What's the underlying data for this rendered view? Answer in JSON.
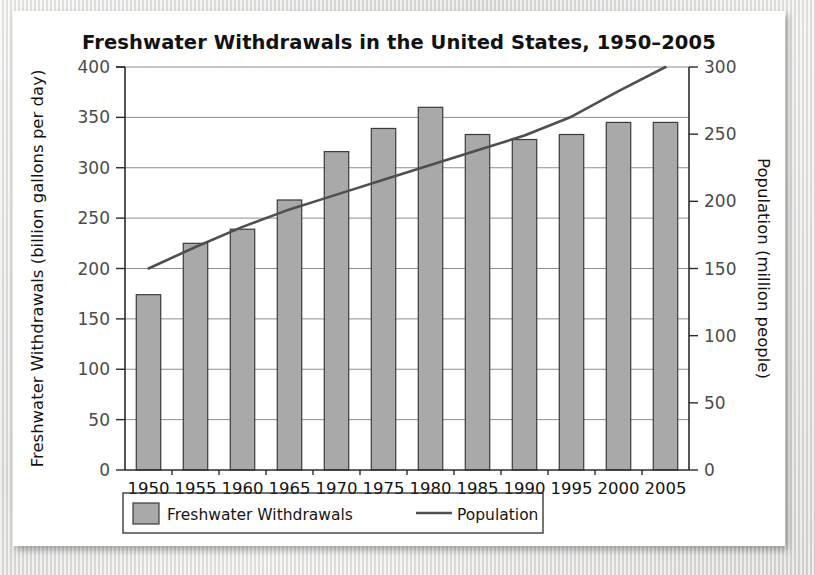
{
  "chart_data": {
    "type": "bar",
    "title": "Freshwater Withdrawals in the United States, 1950–2005",
    "categories": [
      "1950",
      "1955",
      "1960",
      "1965",
      "1970",
      "1975",
      "1980",
      "1985",
      "1990",
      "1995",
      "2000",
      "2005"
    ],
    "xlabel": "",
    "ylabel": "Freshwater Withdrawals (billion gallons per day)",
    "y2label": "Population (million people)",
    "ylim": [
      0,
      400
    ],
    "y2lim": [
      0,
      300
    ],
    "yticks": [
      0,
      50,
      100,
      150,
      200,
      250,
      300,
      350,
      400
    ],
    "y2ticks": [
      0,
      50,
      100,
      150,
      200,
      250,
      300
    ],
    "grid": true,
    "legend_position": "bottom",
    "series": [
      {
        "name": "Freshwater Withdrawals",
        "type": "bar",
        "axis": "left",
        "color": "#a9a9a9",
        "edge_color": "#3a3a3a",
        "values": [
          174,
          225,
          239,
          268,
          316,
          339,
          360,
          333,
          328,
          333,
          345,
          345
        ]
      },
      {
        "name": "Population",
        "type": "line",
        "axis": "right",
        "color": "#4f4f4f",
        "values": [
          150,
          166,
          181,
          194,
          205,
          216,
          227,
          238,
          249,
          263,
          282,
          300
        ]
      }
    ]
  },
  "legend": {
    "items": [
      {
        "label": "Freshwater Withdrawals",
        "marker": "swatch"
      },
      {
        "label": "Population",
        "marker": "line"
      }
    ]
  },
  "colors": {
    "bar_fill": "#a9a9a9",
    "bar_edge": "#3a3a3a",
    "line": "#4f4f4f",
    "grid": "#8e8e8e",
    "axis": "#2b2b2b",
    "text": "#131313",
    "tick_text": "#4b4b4b",
    "card_background": "#ffffff"
  }
}
